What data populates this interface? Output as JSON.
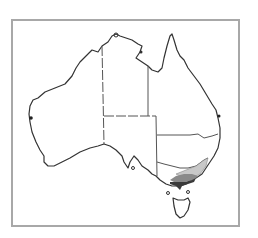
{
  "map": {
    "subject": "Australia distribution map",
    "regions": [
      "Western Australia",
      "Northern Territory",
      "South Australia",
      "Queensland",
      "New South Wales",
      "Victoria",
      "Tasmania"
    ],
    "distribution": {
      "location": "Victoria / south-east New South Wales",
      "shades": [
        {
          "level": "light",
          "color": "#c8c8c8"
        },
        {
          "level": "medium",
          "color": "#8a8a8a"
        },
        {
          "level": "dark",
          "color": "#3a3a3a"
        }
      ]
    },
    "colors": {
      "coastline": "#333333",
      "border": "#555555",
      "frame": "#a8a8a8",
      "background": "#ffffff"
    }
  }
}
